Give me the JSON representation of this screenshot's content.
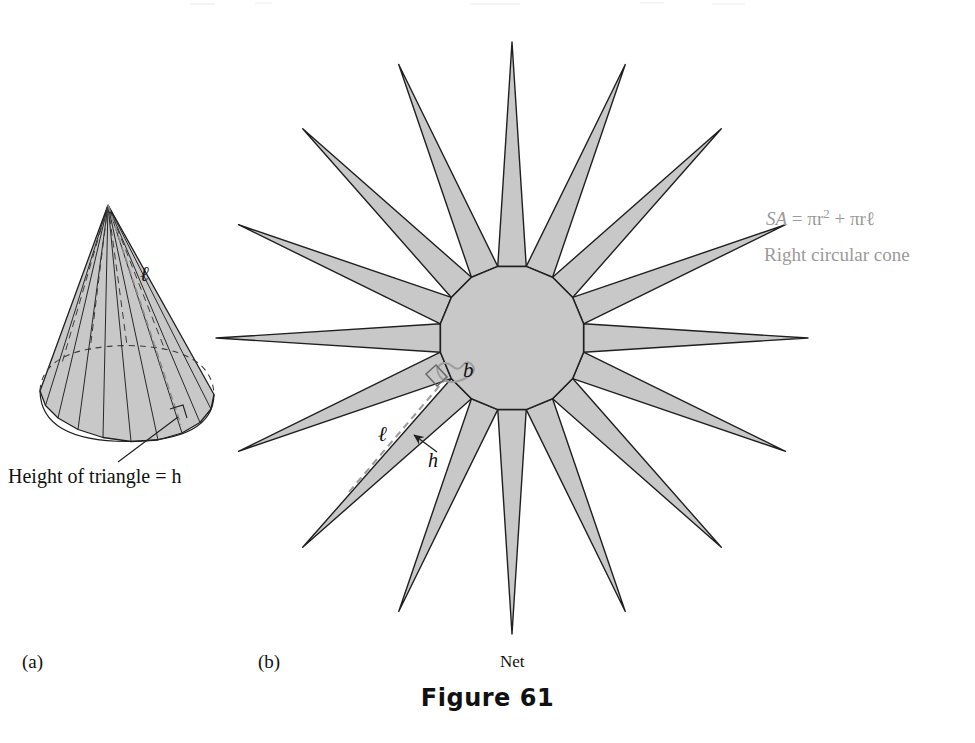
{
  "figure": {
    "number_label": "Figure 61",
    "parts": [
      {
        "key": "a",
        "label": "(a)"
      },
      {
        "key": "b",
        "label": "(b)"
      }
    ],
    "net_caption": "Net"
  },
  "cone": {
    "slant_label": "ℓ",
    "height_callout": "Height of triangle = h"
  },
  "net": {
    "base_label": "b",
    "slant_label": "ℓ",
    "height_label": "h",
    "spike_count": 16,
    "center_x": 512,
    "center_y": 338,
    "inner_radius": 73,
    "outer_radius": 296
  },
  "formula": {
    "expression_prefix": "SA",
    "equals": "=",
    "term_one_base": "πr",
    "term_one_exponent": "2",
    "plus": "+",
    "term_two": "πrℓ",
    "expression_plain": "SA = πr2 + πrℓ",
    "caption": "Right circular cone"
  },
  "colors": {
    "fill_gray": "#c8c8c8",
    "stroke_dark": "#1f1f1f",
    "formula_gray": "#9a9a9a",
    "dash_gray": "#9d9d9d",
    "background": "#ffffff"
  }
}
